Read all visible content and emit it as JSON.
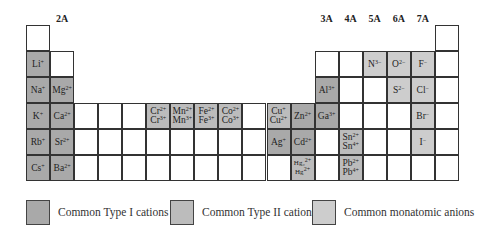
{
  "group_labels": [
    {
      "label": "1A",
      "col": 0,
      "row": -1
    },
    {
      "label": "2A",
      "col": 1,
      "row": 0
    },
    {
      "label": "3A",
      "col": 12,
      "row": 0
    },
    {
      "label": "4A",
      "col": 13,
      "row": 0
    },
    {
      "label": "5A",
      "col": 14,
      "row": 0
    },
    {
      "label": "6A",
      "col": 15,
      "row": 0
    },
    {
      "label": "7A",
      "col": 16,
      "row": 0
    },
    {
      "label": "8A",
      "col": 17,
      "row": -1
    }
  ],
  "colors": {
    "type1": "#a9a9a9",
    "type2": "#bcbcbc",
    "anion": "#cdcdcd",
    "empty": "#ffffff"
  },
  "cells": [
    {
      "col": 0,
      "row": 0,
      "type": "empty",
      "ions": []
    },
    {
      "col": 17,
      "row": 0,
      "type": "empty",
      "ions": []
    },
    {
      "col": 0,
      "row": 1,
      "type": "t1",
      "ions": [
        [
          "Li",
          "+"
        ]
      ]
    },
    {
      "col": 1,
      "row": 1,
      "type": "empty",
      "ions": []
    },
    {
      "col": 12,
      "row": 1,
      "type": "empty",
      "ions": []
    },
    {
      "col": 13,
      "row": 1,
      "type": "empty",
      "ions": []
    },
    {
      "col": 14,
      "row": 1,
      "type": "an",
      "ions": [
        [
          "N",
          "3−"
        ]
      ]
    },
    {
      "col": 15,
      "row": 1,
      "type": "an",
      "ions": [
        [
          "O",
          "2−"
        ]
      ]
    },
    {
      "col": 16,
      "row": 1,
      "type": "an",
      "ions": [
        [
          "F",
          "−"
        ]
      ]
    },
    {
      "col": 17,
      "row": 1,
      "type": "empty",
      "ions": []
    },
    {
      "col": 0,
      "row": 2,
      "type": "t1",
      "ions": [
        [
          "Na",
          "+"
        ]
      ]
    },
    {
      "col": 1,
      "row": 2,
      "type": "t1",
      "ions": [
        [
          "Mg",
          "2+"
        ]
      ]
    },
    {
      "col": 12,
      "row": 2,
      "type": "t1",
      "ions": [
        [
          "Al",
          "3+"
        ]
      ]
    },
    {
      "col": 13,
      "row": 2,
      "type": "empty",
      "ions": []
    },
    {
      "col": 14,
      "row": 2,
      "type": "empty",
      "ions": []
    },
    {
      "col": 15,
      "row": 2,
      "type": "an",
      "ions": [
        [
          "S",
          "2−"
        ]
      ]
    },
    {
      "col": 16,
      "row": 2,
      "type": "an",
      "ions": [
        [
          "Cl",
          "−"
        ]
      ]
    },
    {
      "col": 17,
      "row": 2,
      "type": "empty",
      "ions": []
    },
    {
      "col": 0,
      "row": 3,
      "type": "t1",
      "ions": [
        [
          "K",
          "+"
        ]
      ]
    },
    {
      "col": 1,
      "row": 3,
      "type": "t1",
      "ions": [
        [
          "Ca",
          "2+"
        ]
      ]
    },
    {
      "col": 2,
      "row": 3,
      "type": "empty",
      "ions": []
    },
    {
      "col": 3,
      "row": 3,
      "type": "empty",
      "ions": []
    },
    {
      "col": 4,
      "row": 3,
      "type": "empty",
      "ions": []
    },
    {
      "col": 5,
      "row": 3,
      "type": "t2",
      "ions": [
        [
          "Cr",
          "2+"
        ],
        [
          "Cr",
          "3+"
        ]
      ]
    },
    {
      "col": 6,
      "row": 3,
      "type": "t2",
      "ions": [
        [
          "Mn",
          "2+"
        ],
        [
          "Mn",
          "3+"
        ]
      ]
    },
    {
      "col": 7,
      "row": 3,
      "type": "t2",
      "ions": [
        [
          "Fe",
          "2+"
        ],
        [
          "Fe",
          "3+"
        ]
      ]
    },
    {
      "col": 8,
      "row": 3,
      "type": "t2",
      "ions": [
        [
          "Co",
          "2+"
        ],
        [
          "Co",
          "3+"
        ]
      ]
    },
    {
      "col": 9,
      "row": 3,
      "type": "empty",
      "ions": []
    },
    {
      "col": 10,
      "row": 3,
      "type": "t2",
      "ions": [
        [
          "Cu",
          "+"
        ],
        [
          "Cu",
          "2+"
        ]
      ]
    },
    {
      "col": 11,
      "row": 3,
      "type": "t1",
      "ions": [
        [
          "Zn",
          "2+"
        ]
      ]
    },
    {
      "col": 12,
      "row": 3,
      "type": "t1",
      "ions": [
        [
          "Ga",
          "3+"
        ]
      ]
    },
    {
      "col": 13,
      "row": 3,
      "type": "empty",
      "ions": []
    },
    {
      "col": 14,
      "row": 3,
      "type": "empty",
      "ions": []
    },
    {
      "col": 15,
      "row": 3,
      "type": "empty",
      "ions": []
    },
    {
      "col": 16,
      "row": 3,
      "type": "an",
      "ions": [
        [
          "Br",
          "−"
        ]
      ]
    },
    {
      "col": 17,
      "row": 3,
      "type": "empty",
      "ions": []
    },
    {
      "col": 0,
      "row": 4,
      "type": "t1",
      "ions": [
        [
          "Rb",
          "+"
        ]
      ]
    },
    {
      "col": 1,
      "row": 4,
      "type": "t1",
      "ions": [
        [
          "Sr",
          "2+"
        ]
      ]
    },
    {
      "col": 2,
      "row": 4,
      "type": "empty",
      "ions": []
    },
    {
      "col": 3,
      "row": 4,
      "type": "empty",
      "ions": []
    },
    {
      "col": 4,
      "row": 4,
      "type": "empty",
      "ions": []
    },
    {
      "col": 5,
      "row": 4,
      "type": "empty",
      "ions": []
    },
    {
      "col": 6,
      "row": 4,
      "type": "empty",
      "ions": []
    },
    {
      "col": 7,
      "row": 4,
      "type": "empty",
      "ions": []
    },
    {
      "col": 8,
      "row": 4,
      "type": "empty",
      "ions": []
    },
    {
      "col": 9,
      "row": 4,
      "type": "empty",
      "ions": []
    },
    {
      "col": 10,
      "row": 4,
      "type": "t1",
      "ions": [
        [
          "Ag",
          "+"
        ]
      ]
    },
    {
      "col": 11,
      "row": 4,
      "type": "t1",
      "ions": [
        [
          "Cd",
          "2+"
        ]
      ]
    },
    {
      "col": 12,
      "row": 4,
      "type": "empty",
      "ions": []
    },
    {
      "col": 13,
      "row": 4,
      "type": "t2",
      "ions": [
        [
          "Sn",
          "2+"
        ],
        [
          "Sn",
          "4+"
        ]
      ]
    },
    {
      "col": 14,
      "row": 4,
      "type": "empty",
      "ions": []
    },
    {
      "col": 15,
      "row": 4,
      "type": "empty",
      "ions": []
    },
    {
      "col": 16,
      "row": 4,
      "type": "an",
      "ions": [
        [
          "I",
          "−"
        ]
      ]
    },
    {
      "col": 17,
      "row": 4,
      "type": "empty",
      "ions": []
    },
    {
      "col": 0,
      "row": 5,
      "type": "t1",
      "ions": [
        [
          "Cs",
          "+"
        ]
      ]
    },
    {
      "col": 1,
      "row": 5,
      "type": "t1",
      "ions": [
        [
          "Ba",
          "2+"
        ]
      ]
    },
    {
      "col": 2,
      "row": 5,
      "type": "empty",
      "ions": []
    },
    {
      "col": 3,
      "row": 5,
      "type": "empty",
      "ions": []
    },
    {
      "col": 4,
      "row": 5,
      "type": "empty",
      "ions": []
    },
    {
      "col": 5,
      "row": 5,
      "type": "empty",
      "ions": []
    },
    {
      "col": 6,
      "row": 5,
      "type": "empty",
      "ions": []
    },
    {
      "col": 7,
      "row": 5,
      "type": "empty",
      "ions": []
    },
    {
      "col": 8,
      "row": 5,
      "type": "empty",
      "ions": []
    },
    {
      "col": 9,
      "row": 5,
      "type": "empty",
      "ions": []
    },
    {
      "col": 10,
      "row": 5,
      "type": "empty",
      "ions": []
    },
    {
      "col": 11,
      "row": 5,
      "type": "t2",
      "small": true,
      "ions": [
        [
          "Hg₂",
          "2+"
        ],
        [
          "Hg",
          "2+"
        ]
      ]
    },
    {
      "col": 12,
      "row": 5,
      "type": "empty",
      "ions": []
    },
    {
      "col": 13,
      "row": 5,
      "type": "t2",
      "ions": [
        [
          "Pb",
          "2+"
        ],
        [
          "Pb",
          "4+"
        ]
      ]
    },
    {
      "col": 14,
      "row": 5,
      "type": "empty",
      "ions": []
    },
    {
      "col": 15,
      "row": 5,
      "type": "empty",
      "ions": []
    },
    {
      "col": 16,
      "row": 5,
      "type": "empty",
      "ions": []
    },
    {
      "col": 17,
      "row": 5,
      "type": "empty",
      "ions": []
    }
  ],
  "legend": [
    {
      "label": "Common Type I cations",
      "type": "t1"
    },
    {
      "label": "Common Type II cations",
      "type": "t2"
    },
    {
      "label": "Common monatomic anions",
      "type": "an"
    }
  ]
}
